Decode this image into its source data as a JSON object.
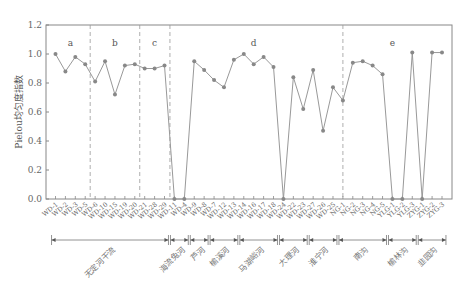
{
  "chart_data": {
    "type": "line",
    "title": "",
    "xlabel": "",
    "ylabel": "Pielou均匀度指数",
    "ylim": [
      0,
      1.2
    ],
    "yticks": [
      "0.0",
      "0.2",
      "0.4",
      "0.6",
      "0.8",
      "1.0",
      "1.2"
    ],
    "grid": false,
    "legend": null,
    "categories": [
      "WD-1",
      "WD-2",
      "WD-3",
      "WD-5",
      "WD-6",
      "WD-10",
      "WD-15",
      "WD-19",
      "WD-20",
      "WD-21",
      "WD-28",
      "WD-29",
      "WD-11",
      "WD-4",
      "WD-9",
      "WD-8",
      "WD-7",
      "WD-12",
      "WD-13",
      "WD-14",
      "WD-16",
      "WD-17",
      "WD-18",
      "WD-24",
      "WD-22",
      "WD-23",
      "WD-27",
      "WD-26",
      "WD-25",
      "NG-1",
      "NG-2",
      "NG-3",
      "NG-4",
      "NG-5",
      "YLG-1",
      "YLG-2",
      "YLG-3",
      "ZYG-1",
      "ZYG-2",
      "ZYG-3"
    ],
    "series": [
      {
        "name": "Pielou均匀度指数",
        "values": [
          1.0,
          0.88,
          0.98,
          0.93,
          0.81,
          0.95,
          0.72,
          0.92,
          0.93,
          0.9,
          0.9,
          0.92,
          0.0,
          0.0,
          0.95,
          0.89,
          0.82,
          0.77,
          0.96,
          1.0,
          0.93,
          0.98,
          0.91,
          0.0,
          0.84,
          0.62,
          0.89,
          0.47,
          0.77,
          0.68,
          0.94,
          0.95,
          0.92,
          0.86,
          0.0,
          0.0,
          1.01,
          0.0,
          1.01,
          1.01
        ]
      }
    ],
    "regions": [
      {
        "letter": "a",
        "start": 0,
        "end": 3
      },
      {
        "letter": "b",
        "start": 4,
        "end": 8
      },
      {
        "letter": "c",
        "start": 9,
        "end": 11
      },
      {
        "letter": "d",
        "start": 12,
        "end": 28
      },
      {
        "letter": "e",
        "start": 29,
        "end": 39
      }
    ],
    "groups": [
      {
        "name": "无定河干流",
        "start": 0,
        "end": 11
      },
      {
        "name": "海流兔河",
        "start": 12,
        "end": 13
      },
      {
        "name": "芦河",
        "start": 14,
        "end": 15
      },
      {
        "name": "榆溪河",
        "start": 16,
        "end": 18
      },
      {
        "name": "马湖峪河",
        "start": 19,
        "end": 22
      },
      {
        "name": "大理河",
        "start": 23,
        "end": 25
      },
      {
        "name": "淮宁河",
        "start": 26,
        "end": 28
      },
      {
        "name": "南沟",
        "start": 29,
        "end": 33
      },
      {
        "name": "榆林沟",
        "start": 34,
        "end": 36
      },
      {
        "name": "韭园沟",
        "start": 37,
        "end": 39
      }
    ],
    "colors": {
      "line": "#999999",
      "marker": "#888888",
      "axis": "#888888",
      "dash": "#999999"
    }
  }
}
